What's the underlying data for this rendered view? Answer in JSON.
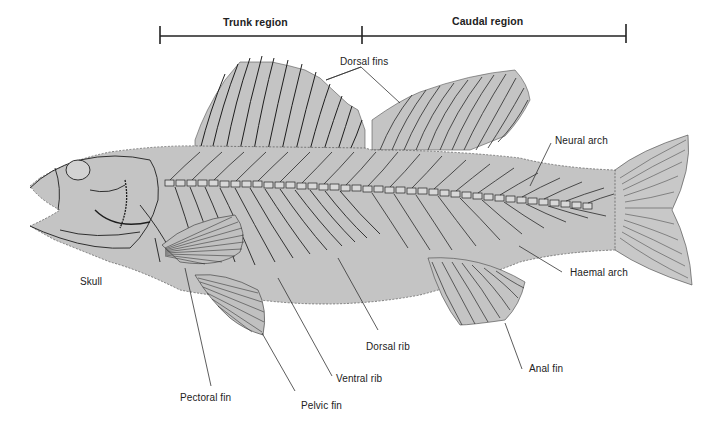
{
  "diagram": {
    "colors": {
      "background": "#ffffff",
      "body_fill": "#c4c4c4",
      "line": "#2a2a2a",
      "label_text": "#222222"
    },
    "regions": [
      {
        "id": "trunk",
        "label": "Trunk region",
        "x_start": 160,
        "x_end": 362
      },
      {
        "id": "caudal",
        "label": "Caudal region",
        "x_start": 362,
        "x_end": 626
      }
    ],
    "labels": {
      "dorsal_fins": "Dorsal fins",
      "neural_arch": "Neural arch",
      "haemal_arch": "Haemal arch",
      "skull": "Skull",
      "dorsal_rib": "Dorsal rib",
      "ventral_rib": "Ventral rib",
      "pectoral_fin": "Pectoral fin",
      "pelvic_fin": "Pelvic fin",
      "anal_fin": "Anal fin"
    }
  }
}
